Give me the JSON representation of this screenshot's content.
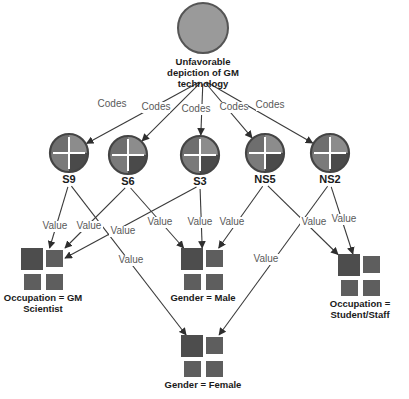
{
  "diagram": {
    "root": {
      "id": "root",
      "label_lines": [
        "Unfavorable",
        "depiction of GM",
        "technology"
      ],
      "x": 203,
      "y": 28,
      "r": 25,
      "fill": "#9a9a9a",
      "stroke": "#555555"
    },
    "codes": [
      {
        "id": "S9",
        "label": "S9",
        "x": 69,
        "y": 153
      },
      {
        "id": "S6",
        "label": "S6",
        "x": 128,
        "y": 155
      },
      {
        "id": "S3",
        "label": "S3",
        "x": 200,
        "y": 155
      },
      {
        "id": "NS5",
        "label": "NS5",
        "x": 265,
        "y": 153
      },
      {
        "id": "NS2",
        "label": "NS2",
        "x": 330,
        "y": 153
      }
    ],
    "code_style": {
      "r": 19,
      "quadrant_colors": [
        "#6e6e6e",
        "#8c8c8c",
        "#7a7a7a",
        "#4a4a4a"
      ],
      "stroke": "#444444",
      "cross": "#ffffff"
    },
    "attributes": [
      {
        "id": "gm_scientist",
        "label_lines": [
          "Occupation = GM",
          "Scientist"
        ],
        "x": 43,
        "y": 270
      },
      {
        "id": "male",
        "label_lines": [
          "Gender = Male"
        ],
        "x": 203,
        "y": 270
      },
      {
        "id": "student",
        "label_lines": [
          "Occupation =",
          "Student/Staff"
        ],
        "x": 360,
        "y": 276
      },
      {
        "id": "female",
        "label_lines": [
          "Gender = Female"
        ],
        "x": 203,
        "y": 357
      }
    ],
    "attribute_style": {
      "fill_dark": "#4d4d4d",
      "fill": "#5e5e5e"
    },
    "edges": [
      {
        "from": "root",
        "to": "S9",
        "label": "Codes",
        "lx": 112,
        "ly": 107
      },
      {
        "from": "root",
        "to": "S6",
        "label": "Codes",
        "lx": 156,
        "ly": 110
      },
      {
        "from": "root",
        "to": "S3",
        "label": "Codes",
        "lx": 196,
        "ly": 112
      },
      {
        "from": "root",
        "to": "NS5",
        "label": "Codes",
        "lx": 234,
        "ly": 110
      },
      {
        "from": "root",
        "to": "NS2",
        "label": "Codes",
        "lx": 270,
        "ly": 108
      },
      {
        "from": "S9",
        "to": "gm_scientist",
        "label": "Value",
        "lx": 55,
        "ly": 229
      },
      {
        "from": "S9",
        "to": "female",
        "label": "Value",
        "lx": 131,
        "ly": 263
      },
      {
        "from": "S6",
        "to": "gm_scientist",
        "label": "Value",
        "lx": 89,
        "ly": 229
      },
      {
        "from": "S6",
        "to": "male",
        "label": "Value",
        "lx": 160,
        "ly": 225
      },
      {
        "from": "S3",
        "to": "gm_scientist",
        "label": "Value",
        "lx": 123,
        "ly": 234
      },
      {
        "from": "S3",
        "to": "male",
        "label": "Value",
        "lx": 200,
        "ly": 225
      },
      {
        "from": "NS5",
        "to": "male",
        "label": "Value",
        "lx": 232,
        "ly": 225
      },
      {
        "from": "NS5",
        "to": "student",
        "label": "Value",
        "lx": 314,
        "ly": 225
      },
      {
        "from": "NS2",
        "to": "student",
        "label": "Value",
        "lx": 344,
        "ly": 222
      },
      {
        "from": "NS2",
        "to": "female",
        "label": "Value",
        "lx": 266,
        "ly": 262
      }
    ],
    "edge_color": "#3a3a3a",
    "edge_label_color": "#5a5a5a"
  }
}
